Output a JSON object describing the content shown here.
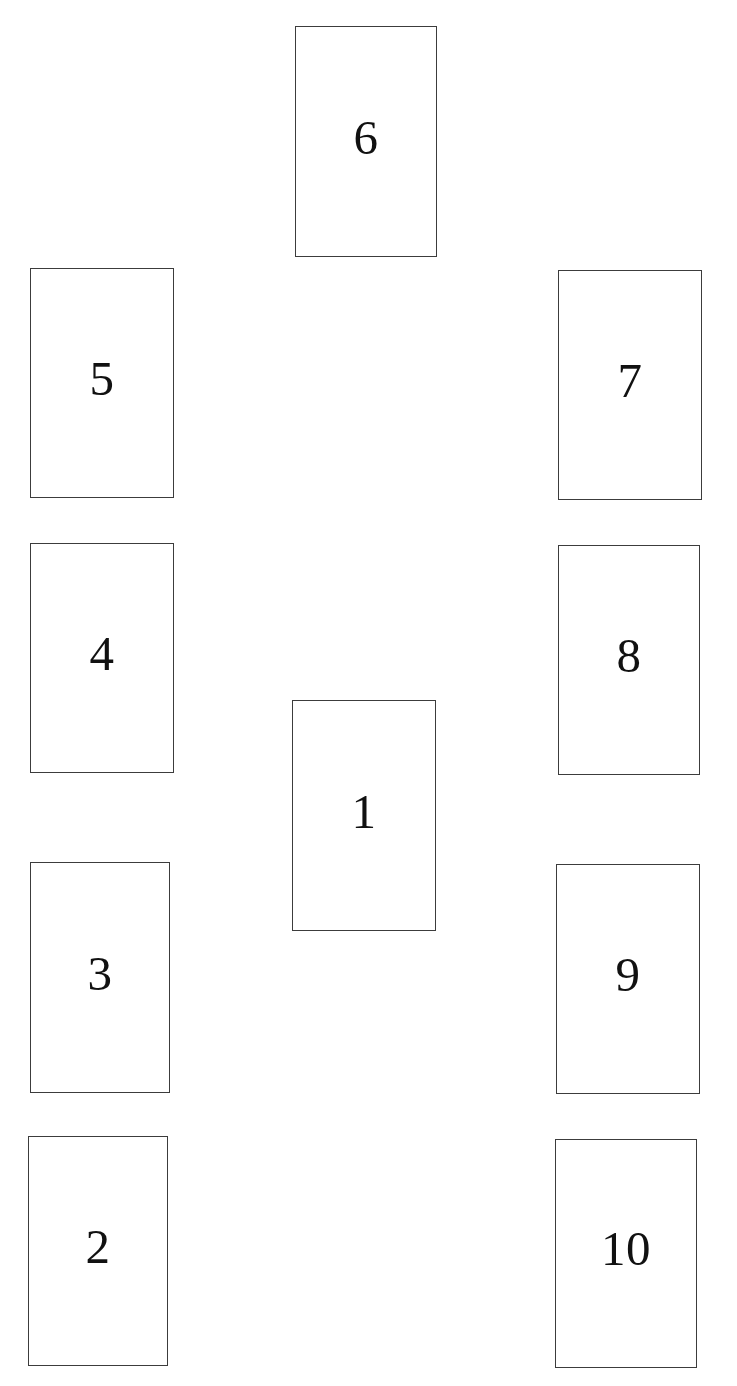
{
  "page": {
    "background_color": "#ffffff",
    "width": 737,
    "height": 1386
  },
  "style": {
    "card_fill": "#ffffff",
    "card_border_color": "#3c3c3c",
    "label_color": "#111111",
    "label_font_size_px": 49,
    "border_width_px": 1
  },
  "cards": [
    {
      "id": "card-6",
      "label": "6",
      "column": "center",
      "x": 295,
      "y": 26,
      "width": 142,
      "height": 231,
      "label_offset_y": 86
    },
    {
      "id": "card-5",
      "label": "5",
      "column": "left",
      "x": 30,
      "y": 268,
      "width": 144,
      "height": 230,
      "label_offset_y": 85
    },
    {
      "id": "card-7",
      "label": "7",
      "column": "right",
      "x": 558,
      "y": 270,
      "width": 144,
      "height": 230,
      "label_offset_y": 85
    },
    {
      "id": "card-4",
      "label": "4",
      "column": "left",
      "x": 30,
      "y": 543,
      "width": 144,
      "height": 230,
      "label_offset_y": 85
    },
    {
      "id": "card-8",
      "label": "8",
      "column": "right",
      "x": 558,
      "y": 545,
      "width": 142,
      "height": 230,
      "label_offset_y": 85
    },
    {
      "id": "card-1",
      "label": "1",
      "column": "center",
      "x": 292,
      "y": 700,
      "width": 144,
      "height": 231,
      "label_offset_y": 86
    },
    {
      "id": "card-3",
      "label": "3",
      "column": "left",
      "x": 30,
      "y": 862,
      "width": 140,
      "height": 231,
      "label_offset_y": 86
    },
    {
      "id": "card-9",
      "label": "9",
      "column": "right",
      "x": 556,
      "y": 864,
      "width": 144,
      "height": 230,
      "label_offset_y": 85
    },
    {
      "id": "card-2",
      "label": "2",
      "column": "left",
      "x": 28,
      "y": 1136,
      "width": 140,
      "height": 230,
      "label_offset_y": 85
    },
    {
      "id": "card-10",
      "label": "10",
      "column": "right",
      "x": 555,
      "y": 1139,
      "width": 142,
      "height": 229,
      "label_offset_y": 84
    }
  ]
}
